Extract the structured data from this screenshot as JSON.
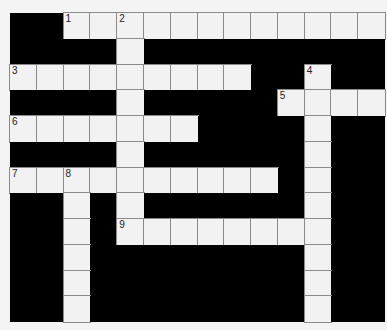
{
  "puzzle": {
    "cols": 14,
    "rows": 12,
    "colors": {
      "block": "#000000",
      "cell": "#f2f2f2",
      "line": "#8a8a8a"
    },
    "white_cells": [
      [
        0,
        2
      ],
      [
        0,
        3
      ],
      [
        0,
        4
      ],
      [
        0,
        5
      ],
      [
        0,
        6
      ],
      [
        0,
        7
      ],
      [
        0,
        8
      ],
      [
        0,
        9
      ],
      [
        0,
        10
      ],
      [
        0,
        11
      ],
      [
        0,
        12
      ],
      [
        0,
        13
      ],
      [
        1,
        4
      ],
      [
        2,
        0
      ],
      [
        2,
        1
      ],
      [
        2,
        2
      ],
      [
        2,
        3
      ],
      [
        2,
        4
      ],
      [
        2,
        5
      ],
      [
        2,
        6
      ],
      [
        2,
        7
      ],
      [
        2,
        8
      ],
      [
        2,
        11
      ],
      [
        3,
        4
      ],
      [
        3,
        10
      ],
      [
        3,
        11
      ],
      [
        3,
        12
      ],
      [
        3,
        13
      ],
      [
        4,
        0
      ],
      [
        4,
        1
      ],
      [
        4,
        2
      ],
      [
        4,
        3
      ],
      [
        4,
        4
      ],
      [
        4,
        5
      ],
      [
        4,
        6
      ],
      [
        4,
        11
      ],
      [
        5,
        4
      ],
      [
        5,
        11
      ],
      [
        6,
        0
      ],
      [
        6,
        1
      ],
      [
        6,
        2
      ],
      [
        6,
        3
      ],
      [
        6,
        4
      ],
      [
        6,
        5
      ],
      [
        6,
        6
      ],
      [
        6,
        7
      ],
      [
        6,
        8
      ],
      [
        6,
        9
      ],
      [
        6,
        11
      ],
      [
        7,
        2
      ],
      [
        7,
        4
      ],
      [
        7,
        11
      ],
      [
        8,
        2
      ],
      [
        8,
        4
      ],
      [
        8,
        5
      ],
      [
        8,
        6
      ],
      [
        8,
        7
      ],
      [
        8,
        8
      ],
      [
        8,
        9
      ],
      [
        8,
        10
      ],
      [
        8,
        11
      ],
      [
        9,
        2
      ],
      [
        9,
        11
      ],
      [
        10,
        2
      ],
      [
        10,
        11
      ],
      [
        11,
        2
      ],
      [
        11,
        11
      ]
    ],
    "numbers": [
      {
        "r": 0,
        "c": 2,
        "n": "1"
      },
      {
        "r": 0,
        "c": 4,
        "n": "2"
      },
      {
        "r": 2,
        "c": 0,
        "n": "3"
      },
      {
        "r": 2,
        "c": 11,
        "n": "4"
      },
      {
        "r": 3,
        "c": 10,
        "n": "5"
      },
      {
        "r": 4,
        "c": 0,
        "n": "6"
      },
      {
        "r": 6,
        "c": 0,
        "n": "7"
      },
      {
        "r": 6,
        "c": 2,
        "n": "8"
      },
      {
        "r": 8,
        "c": 4,
        "n": "9"
      }
    ]
  }
}
